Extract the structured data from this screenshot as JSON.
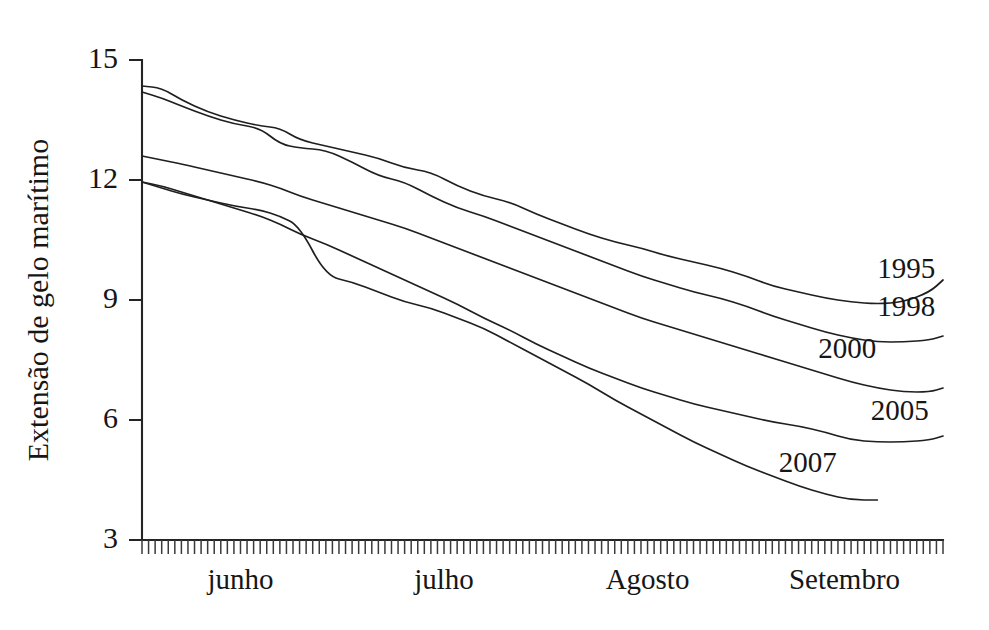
{
  "chart_data": {
    "type": "line",
    "title": "",
    "subtitle": "",
    "xlabel": "",
    "ylabel": "Extensão de gelo marítimo",
    "ylim": [
      3,
      15
    ],
    "yticks": [
      3,
      6,
      9,
      12,
      15
    ],
    "ytick_labels": [
      "3",
      "6",
      "9",
      "12",
      "15"
    ],
    "xlim": [
      0,
      122
    ],
    "grid": false,
    "legend_position": "inline-right-of-curves",
    "xtick_labels": [
      "junho",
      "julho",
      "Agosto",
      "Setembro"
    ],
    "xtick_positions": [
      15,
      46,
      77,
      107
    ],
    "xaxis_minor_ticks": "daily ticks across full axis",
    "x_units": "days from 1 June through end of September",
    "series": [
      {
        "name": "1995",
        "label": "1995",
        "label_x": 112,
        "label_y": 9.55,
        "x": [
          0,
          3,
          6,
          10,
          14,
          18,
          21,
          24,
          28,
          32,
          36,
          40,
          44,
          48,
          52,
          56,
          60,
          64,
          68,
          72,
          76,
          80,
          84,
          88,
          92,
          96,
          100,
          104,
          108,
          112,
          116,
          120,
          122
        ],
        "values": [
          14.35,
          14.3,
          14.0,
          13.7,
          13.5,
          13.35,
          13.3,
          13.0,
          12.85,
          12.7,
          12.55,
          12.3,
          12.2,
          11.85,
          11.6,
          11.45,
          11.15,
          10.9,
          10.65,
          10.45,
          10.3,
          10.1,
          9.95,
          9.8,
          9.6,
          9.35,
          9.2,
          9.05,
          8.95,
          8.9,
          8.95,
          9.2,
          9.5
        ]
      },
      {
        "name": "1998",
        "label": "1998",
        "label_x": 112,
        "label_y": 8.6,
        "x": [
          0,
          3,
          6,
          10,
          14,
          18,
          21,
          24,
          28,
          32,
          36,
          40,
          44,
          48,
          52,
          56,
          60,
          64,
          68,
          72,
          76,
          80,
          84,
          88,
          92,
          96,
          100,
          104,
          108,
          112,
          116,
          120,
          122
        ],
        "values": [
          14.2,
          14.05,
          13.85,
          13.6,
          13.4,
          13.3,
          12.9,
          12.8,
          12.75,
          12.45,
          12.1,
          11.95,
          11.6,
          11.3,
          11.1,
          10.85,
          10.6,
          10.35,
          10.1,
          9.85,
          9.6,
          9.4,
          9.2,
          9.05,
          8.85,
          8.6,
          8.4,
          8.2,
          8.05,
          7.95,
          7.95,
          8.0,
          8.1
        ]
      },
      {
        "name": "2000",
        "label": "2000",
        "label_x": 103,
        "label_y": 7.55,
        "x": [
          0,
          3,
          6,
          10,
          14,
          18,
          21,
          24,
          28,
          32,
          36,
          40,
          44,
          48,
          52,
          56,
          60,
          64,
          68,
          72,
          76,
          80,
          84,
          88,
          92,
          96,
          100,
          104,
          108,
          112,
          116,
          120,
          122
        ],
        "values": [
          12.6,
          12.5,
          12.4,
          12.25,
          12.1,
          11.95,
          11.8,
          11.6,
          11.4,
          11.2,
          11.0,
          10.8,
          10.55,
          10.3,
          10.05,
          9.8,
          9.55,
          9.3,
          9.05,
          8.8,
          8.55,
          8.35,
          8.15,
          7.95,
          7.75,
          7.55,
          7.35,
          7.15,
          6.95,
          6.8,
          6.7,
          6.7,
          6.8
        ]
      },
      {
        "name": "2005",
        "label": "2005",
        "label_x": 111,
        "label_y": 6.0,
        "x": [
          0,
          3,
          6,
          10,
          14,
          18,
          21,
          24,
          28,
          32,
          36,
          40,
          44,
          48,
          52,
          56,
          60,
          64,
          68,
          72,
          76,
          80,
          84,
          88,
          92,
          96,
          100,
          104,
          108,
          112,
          116,
          120,
          122
        ],
        "values": [
          11.95,
          11.85,
          11.7,
          11.5,
          11.3,
          11.1,
          10.9,
          10.65,
          10.4,
          10.1,
          9.8,
          9.5,
          9.2,
          8.9,
          8.55,
          8.25,
          7.9,
          7.6,
          7.3,
          7.05,
          6.8,
          6.6,
          6.4,
          6.25,
          6.1,
          5.95,
          5.85,
          5.7,
          5.5,
          5.45,
          5.45,
          5.5,
          5.6
        ]
      },
      {
        "name": "2007",
        "label": "2007",
        "label_x": 97,
        "label_y": 4.7,
        "x": [
          0,
          3,
          6,
          10,
          14,
          18,
          21,
          24,
          28,
          32,
          36,
          40,
          44,
          48,
          52,
          56,
          60,
          64,
          68,
          72,
          76,
          80,
          84,
          88,
          92,
          96,
          100,
          104,
          108,
          112
        ],
        "values": [
          11.95,
          11.8,
          11.65,
          11.5,
          11.35,
          11.25,
          11.1,
          10.85,
          9.6,
          9.45,
          9.2,
          8.95,
          8.8,
          8.55,
          8.3,
          7.95,
          7.6,
          7.25,
          6.9,
          6.5,
          6.15,
          5.8,
          5.45,
          5.15,
          4.85,
          4.6,
          4.35,
          4.15,
          4.0,
          4.0
        ]
      }
    ]
  }
}
